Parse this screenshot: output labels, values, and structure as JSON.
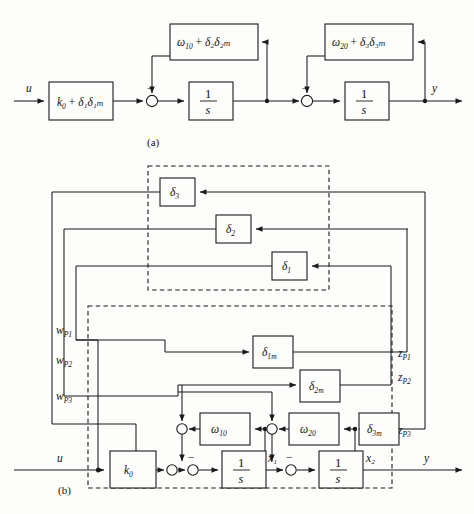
{
  "figure": {
    "captions": {
      "a": "(a)",
      "b": "(b)"
    }
  },
  "diagram_a": {
    "signals": {
      "input": "u",
      "output": "y"
    },
    "blocks": [
      {
        "id": "gain_a",
        "label": "k₀ + δ₁δ₁ₘ",
        "base": "k",
        "base_sub": "0",
        "term": "δ₁δ₁ₘ"
      },
      {
        "id": "int_a1",
        "label": "1/s",
        "numerator": "1",
        "denominator": "s"
      },
      {
        "id": "int_a2",
        "label": "1/s",
        "numerator": "1",
        "denominator": "s"
      },
      {
        "id": "fb_a1",
        "label": "ω₁₀ + δ₂δ₂ₘ",
        "base": "ω",
        "base_sub": "10",
        "term": "δ₂δ₂ₘ"
      },
      {
        "id": "fb_a2",
        "label": "ω₂₀ + δ₃δ₃ₘ",
        "base": "ω",
        "base_sub": "20",
        "term": "δ₃δ₃ₘ"
      }
    ],
    "summers": [
      {
        "id": "sum_a1",
        "sign": "−"
      },
      {
        "id": "sum_a2",
        "sign": "−"
      }
    ]
  },
  "diagram_b": {
    "signals": {
      "input": "u",
      "output": "y",
      "state_1": "x₁",
      "state_2": "x₂",
      "w": [
        "wₚ₁",
        "wₚ₂",
        "wₚ₃"
      ],
      "z": [
        "zₚ₁",
        "zₚ₂",
        "zₚ₃"
      ]
    },
    "uncertainty_blocks": [
      {
        "id": "delta3",
        "base": "δ",
        "sub": "3"
      },
      {
        "id": "delta2",
        "base": "δ",
        "sub": "2"
      },
      {
        "id": "delta1",
        "base": "δ",
        "sub": "1"
      }
    ],
    "nominal_blocks": [
      {
        "id": "delta1m",
        "base": "δ",
        "sub": "1m"
      },
      {
        "id": "delta2m",
        "base": "δ",
        "sub": "2m"
      },
      {
        "id": "delta3m",
        "base": "δ",
        "sub": "3m"
      },
      {
        "id": "omega10",
        "base": "ω",
        "sub": "10"
      },
      {
        "id": "omega20",
        "base": "ω",
        "sub": "20"
      },
      {
        "id": "k0",
        "base": "k",
        "sub": "0"
      },
      {
        "id": "int_b1",
        "numerator": "1",
        "denominator": "s"
      },
      {
        "id": "int_b2",
        "numerator": "1",
        "denominator": "s"
      }
    ],
    "summers": [
      {
        "id": "sum_b_omega1",
        "sign": ""
      },
      {
        "id": "sum_b_omega2",
        "sign": ""
      },
      {
        "id": "sum_b_in1",
        "sign": ""
      },
      {
        "id": "sum_b_in2",
        "sign": "−"
      },
      {
        "id": "sum_b_in3",
        "sign": "−"
      }
    ],
    "labels": {
      "w_p1": "w",
      "w_p1_sub": "P1",
      "w_p2_sub": "P2",
      "w_p3_sub": "P3",
      "z_p1": "z",
      "z_p1_sub": "P1",
      "z_p2_sub": "P2",
      "z_p3_sub": "P3"
    }
  },
  "colors": {
    "line": "#1a1a1a",
    "background": "#fdfdfc",
    "text": "#111111"
  }
}
